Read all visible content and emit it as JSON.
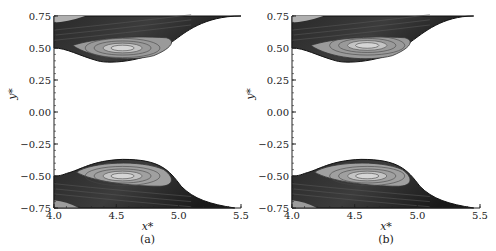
{
  "chart_data": [
    {
      "type": "heatmap",
      "panel_label": "(a)",
      "title": "",
      "xlabel": "x*",
      "ylabel": "y*",
      "xlim": [
        4.0,
        5.5
      ],
      "ylim": [
        -0.75,
        0.75
      ],
      "xticks": [
        4.0,
        4.5,
        5.0,
        5.5
      ],
      "xtick_labels": [
        "4.0",
        "4.5",
        "5.0",
        "5.5"
      ],
      "yticks": [
        0.75,
        0.5,
        0.25,
        0.0,
        -0.25,
        -0.5,
        -0.75
      ],
      "ytick_labels": [
        "0.75",
        "0.50",
        "0.25",
        "0.00",
        "−0.25",
        "−0.50",
        "−0.75"
      ],
      "grid": false,
      "description": "Grayscale contour plot of two droplet/bubble interfaces: upper lobe hanging from y*=0.75 between x*≈4.0 and 5.5 with a recirculation vortex centred near (4.55, 0.50); lower lobe mirrored near y*=-0.75 with vortex near (4.55, -0.50).",
      "upper_region": {
        "x_start": 4.0,
        "x_end": 5.5,
        "min_y": 0.37,
        "vortex_center": [
          4.55,
          0.5
        ]
      },
      "lower_region": {
        "x_start": 4.0,
        "x_end": 5.45,
        "max_y": -0.37,
        "vortex_center": [
          4.55,
          -0.5
        ]
      }
    },
    {
      "type": "heatmap",
      "panel_label": "(b)",
      "title": "",
      "xlabel": "x*",
      "ylabel": "y*",
      "xlim": [
        4.0,
        5.5
      ],
      "ylim": [
        -0.75,
        0.75
      ],
      "xticks": [
        4.0,
        4.5,
        5.0,
        5.5
      ],
      "xtick_labels": [
        "4.0",
        "4.5",
        "5.0",
        "5.5"
      ],
      "yticks": [
        0.75,
        0.5,
        0.25,
        0.0,
        -0.25,
        -0.5,
        -0.75
      ],
      "ytick_labels": [
        "0.75",
        "0.50",
        "0.25",
        "0.00",
        "−0.25",
        "−0.50",
        "−0.75"
      ],
      "grid": false,
      "description": "Same configuration as (a) with slightly different contour field; vortex centres near (4.6, 0.52) and (4.6, -0.50).",
      "upper_region": {
        "x_start": 4.0,
        "x_end": 5.45,
        "min_y": 0.37,
        "vortex_center": [
          4.6,
          0.52
        ]
      },
      "lower_region": {
        "x_start": 4.0,
        "x_end": 5.45,
        "max_y": -0.37,
        "vortex_center": [
          4.6,
          -0.5
        ]
      }
    }
  ]
}
